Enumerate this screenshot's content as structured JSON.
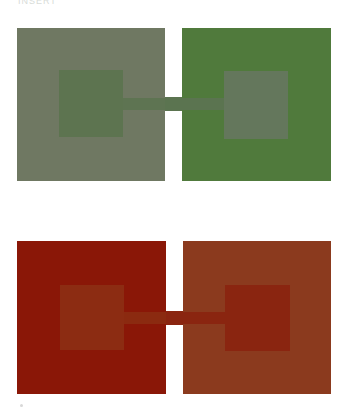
{
  "caption": "INSERT",
  "panels": [
    {
      "name": "top-pair",
      "left_square": {
        "x": 17,
        "y": 28,
        "w": 148,
        "h": 153,
        "color": "#6f7862"
      },
      "left_inner": {
        "x": 59,
        "y": 70,
        "w": 64,
        "h": 67,
        "color": "#5d7450"
      },
      "right_square": {
        "x": 182,
        "y": 28,
        "w": 149,
        "h": 153,
        "color": "#507a3c"
      },
      "right_inner": {
        "x": 224,
        "y": 71,
        "w": 64,
        "h": 68,
        "color": "#64775c"
      },
      "bridge_outer": {
        "x": 165,
        "y": 97,
        "w": 17,
        "h": 14,
        "color": "#5b7450"
      },
      "bridge_left_inner": {
        "x": 123,
        "y": 98,
        "w": 42,
        "h": 12,
        "color": "#5e7452"
      },
      "bridge_right_inner": {
        "x": 182,
        "y": 98,
        "w": 42,
        "h": 12,
        "color": "#5b7450"
      }
    },
    {
      "name": "bottom-pair",
      "left_square": {
        "x": 17,
        "y": 241,
        "w": 149,
        "h": 153,
        "color": "#8a1707"
      },
      "left_inner": {
        "x": 60,
        "y": 285,
        "w": 64,
        "h": 65,
        "color": "#8c2c12"
      },
      "right_square": {
        "x": 183,
        "y": 241,
        "w": 148,
        "h": 153,
        "color": "#8b3a1e"
      },
      "right_inner": {
        "x": 225,
        "y": 285,
        "w": 65,
        "h": 66,
        "color": "#8a2510"
      },
      "bridge_outer": {
        "x": 166,
        "y": 311,
        "w": 17,
        "h": 14,
        "color": "#8a2510"
      },
      "bridge_left_inner": {
        "x": 124,
        "y": 312,
        "w": 42,
        "h": 12,
        "color": "#8b2a10"
      },
      "bridge_right_inner": {
        "x": 183,
        "y": 312,
        "w": 42,
        "h": 12,
        "color": "#8a2510"
      }
    }
  ],
  "footnote_dot": {
    "x": 20,
    "y": 404
  }
}
